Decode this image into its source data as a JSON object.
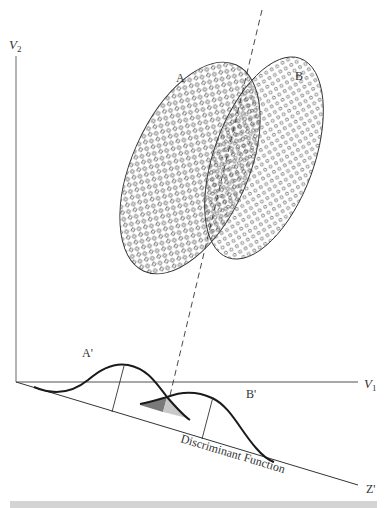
{
  "diagram": {
    "title": "Discriminant Function",
    "axes": {
      "vertical_label": "V",
      "vertical_sub": "2",
      "horizontal_label": "V",
      "horizontal_sub": "1",
      "projection_label": "Z'"
    },
    "groups": [
      {
        "label": "A",
        "marker": "square",
        "projected_label": "A'"
      },
      {
        "label": "B",
        "marker": "circle",
        "projected_label": "B'"
      }
    ],
    "discriminant_label": "Discriminant Function",
    "colors": {
      "axis": "#8a8a8a",
      "curve": "#1a1a1a",
      "overlap_dark": "#7a7a7a",
      "overlap_light": "#c8c8c8",
      "bottom_bar": "#d4d4d4"
    }
  }
}
